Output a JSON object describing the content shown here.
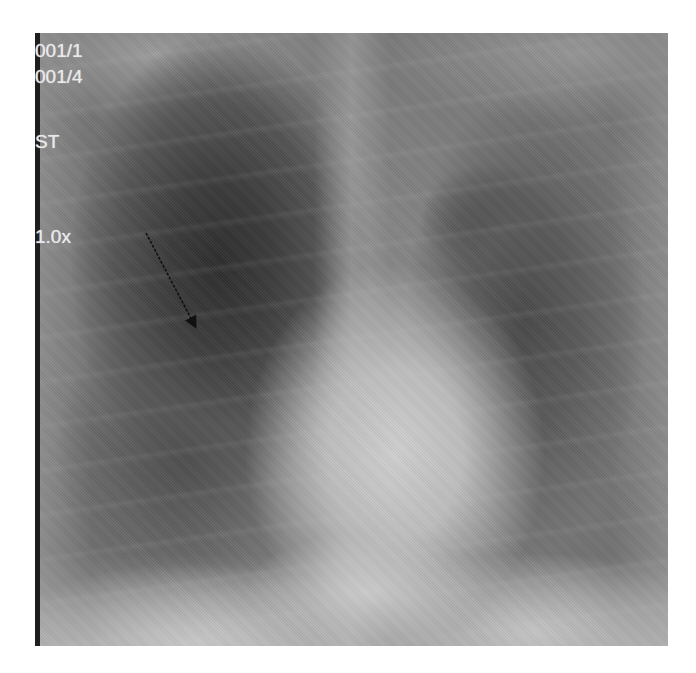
{
  "image": {
    "type": "chest-radiograph-PA",
    "colors": {
      "background": "#ffffff",
      "overlay_text": "#e9e9e9",
      "arrow": "#111111"
    }
  },
  "overlay": {
    "line1": "001/1",
    "line2": "001/4",
    "line3": "ST",
    "zoom": "1.0x"
  },
  "annotation": {
    "arrow": {
      "from": [
        111,
        200
      ],
      "to": [
        162,
        297
      ],
      "label": ""
    }
  }
}
